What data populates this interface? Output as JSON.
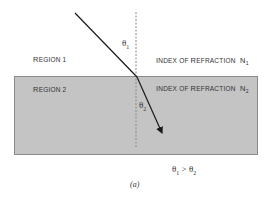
{
  "diagram": {
    "regions": [
      {
        "label_first": "R",
        "label_rest": "EGION 1",
        "index_label_first_a": "I",
        "index_label_rest_a": "NDEX OF ",
        "index_label_first_b": "R",
        "index_label_rest_b": "EFRACTION",
        "n_symbol": "N",
        "n_sub": "1"
      },
      {
        "label_first": "R",
        "label_rest": "EGION 2",
        "index_label_first_a": "I",
        "index_label_rest_a": "NDEX OF ",
        "index_label_first_b": "R",
        "index_label_rest_b": "EFRACTION",
        "n_symbol": "N",
        "n_sub": "2"
      }
    ],
    "angles": {
      "incident_symbol": "θ",
      "incident_sub": "1",
      "refracted_symbol": "θ",
      "refracted_sub": "2"
    },
    "relation": {
      "lhs": "θ",
      "lhs_sub": "1",
      "op": " > ",
      "rhs": "θ",
      "rhs_sub": "2"
    },
    "caption": "(a)",
    "colors": {
      "region2_fill": "#c4c4c4",
      "region2_border": "#8a8a8a",
      "ray": "#1a1a1a",
      "normal": "#888888"
    }
  }
}
